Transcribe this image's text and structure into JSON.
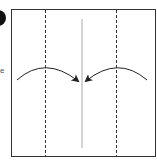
{
  "diagram": {
    "type": "origami-fold-step",
    "step_badge": {
      "label": "",
      "color": "#111111"
    },
    "side_text": "e",
    "colors": {
      "paper_border": "#333333",
      "valley_fold": "#333333",
      "center_crease": "#aaaaaa",
      "arrow": "#222222"
    },
    "lines": [
      {
        "name": "left-valley-fold",
        "style": "dashed"
      },
      {
        "name": "right-valley-fold",
        "style": "dashed"
      },
      {
        "name": "center-crease",
        "style": "solid"
      }
    ],
    "arrows": [
      {
        "name": "left-fold-arrow",
        "direction": "toward-center"
      },
      {
        "name": "right-fold-arrow",
        "direction": "toward-center"
      }
    ]
  }
}
